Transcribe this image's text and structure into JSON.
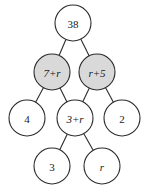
{
  "diagram": {
    "type": "number-pyramid",
    "background_color": "#ffffff",
    "outline_color": "#2b2b2b",
    "shaded_fill_color": "#d9d9d9",
    "white_fill_color": "#ffffff",
    "node_radius": 18,
    "rows": [
      {
        "row_index": 0,
        "nodes": [
          {
            "id": "top",
            "label": "38",
            "shaded": false,
            "italic": false,
            "cx": 73,
            "cy": 23
          }
        ]
      },
      {
        "row_index": 1,
        "nodes": [
          {
            "id": "l1",
            "label": "7+r",
            "shaded": true,
            "italic": true,
            "cx": 52,
            "cy": 72
          },
          {
            "id": "r1",
            "label": "r+5",
            "shaded": true,
            "italic": true,
            "cx": 97,
            "cy": 72
          }
        ]
      },
      {
        "row_index": 2,
        "nodes": [
          {
            "id": "a2",
            "label": "4",
            "shaded": false,
            "italic": false,
            "cx": 27,
            "cy": 118
          },
          {
            "id": "b2",
            "label": "3+r",
            "shaded": false,
            "italic": true,
            "cx": 75,
            "cy": 118
          },
          {
            "id": "c2",
            "label": "2",
            "shaded": false,
            "italic": false,
            "cx": 122,
            "cy": 118
          }
        ]
      },
      {
        "row_index": 3,
        "nodes": [
          {
            "id": "a3",
            "label": "3",
            "shaded": false,
            "italic": false,
            "cx": 52,
            "cy": 166
          },
          {
            "id": "b3",
            "label": "r",
            "shaded": false,
            "italic": true,
            "cx": 102,
            "cy": 166
          }
        ]
      }
    ],
    "edges": [
      {
        "from": "top",
        "to": "l1"
      },
      {
        "from": "top",
        "to": "r1"
      },
      {
        "from": "l1",
        "to": "a2"
      },
      {
        "from": "l1",
        "to": "b2"
      },
      {
        "from": "r1",
        "to": "b2"
      },
      {
        "from": "r1",
        "to": "c2"
      },
      {
        "from": "b2",
        "to": "a3"
      },
      {
        "from": "b2",
        "to": "b3"
      }
    ]
  }
}
